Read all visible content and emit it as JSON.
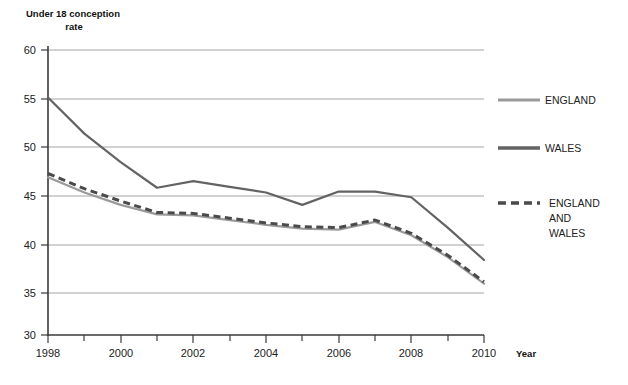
{
  "chart_data": {
    "type": "line",
    "title": "Under 18 conception rate",
    "xlabel": "Year",
    "ylabel": "Under 18 conception rate",
    "x": [
      1998,
      1999,
      2000,
      2001,
      2002,
      2003,
      2004,
      2005,
      2006,
      2007,
      2008,
      2009,
      2010
    ],
    "xlim": [
      1998,
      2010
    ],
    "ylim": [
      30,
      60
    ],
    "yticks": [
      30,
      35,
      40,
      45,
      50,
      55,
      60
    ],
    "xticks_labeled": [
      1998,
      2000,
      2002,
      2004,
      2006,
      2008,
      2010
    ],
    "grid": true,
    "legend_position": "right",
    "series": [
      {
        "name": "ENGLAND",
        "style": "solid",
        "color": "#9a9a9a",
        "values": [
          46.6,
          45.0,
          43.7,
          42.7,
          42.6,
          42.1,
          41.6,
          41.2,
          41.1,
          41.9,
          40.5,
          38.2,
          35.4
        ]
      },
      {
        "name": "WALES",
        "style": "solid",
        "color": "#636363",
        "values": [
          55.0,
          51.2,
          48.2,
          45.5,
          46.2,
          45.6,
          45.0,
          43.7,
          45.1,
          45.1,
          44.5,
          41.3,
          37.9
        ]
      },
      {
        "name": "ENGLAND AND WALES",
        "style": "dashed",
        "color": "#4a4a4a",
        "values": [
          47.0,
          45.4,
          44.1,
          42.9,
          42.8,
          42.3,
          41.8,
          41.4,
          41.3,
          42.1,
          40.7,
          38.4,
          35.6
        ]
      }
    ]
  },
  "axes": {
    "y_title_line1": "Under 18 conception",
    "y_title_line2": "rate",
    "x_title": "Year",
    "y_tick_labels": [
      "60",
      "55",
      "50",
      "45",
      "40",
      "35",
      "30"
    ],
    "x_tick_labels": [
      "1998",
      "2000",
      "2002",
      "2004",
      "2006",
      "2008",
      "2010"
    ]
  },
  "legend": {
    "items": [
      {
        "label": "ENGLAND",
        "label_lines": [
          "ENGLAND"
        ],
        "swatch": "solid-line-swatch",
        "color": "#9a9a9a"
      },
      {
        "label": "WALES",
        "label_lines": [
          "WALES"
        ],
        "swatch": "solid-line-swatch",
        "color": "#636363"
      },
      {
        "label": "ENGLAND AND WALES",
        "label_lines": [
          "ENGLAND",
          "AND",
          "WALES"
        ],
        "swatch": "dashed-line-swatch",
        "color": "#4a4a4a"
      }
    ]
  }
}
